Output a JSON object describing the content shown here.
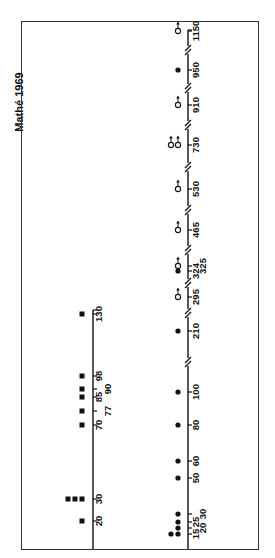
{
  "title": "Mathé 1969",
  "chart_data": {
    "type": "scatter",
    "title": "Mathé 1969",
    "orientation": "rotated 90° (axes run vertically, values increase upward)",
    "panels": [
      {
        "name": "left-axis",
        "marker": "filled-square",
        "tick_labels": [
          "20",
          "30",
          "70",
          "77",
          "85",
          "90",
          "98",
          "130"
        ],
        "points": [
          {
            "x": 20,
            "count": 1
          },
          {
            "x": 30,
            "count": 3
          },
          {
            "x": 70,
            "count": 1
          },
          {
            "x": 77,
            "count": 1
          },
          {
            "x": 85,
            "count": 1
          },
          {
            "x": 90,
            "count": 1
          },
          {
            "x": 98,
            "count": 1
          },
          {
            "x": 130,
            "count": 1
          }
        ]
      },
      {
        "name": "right-axis",
        "axis_breaks": [
          "100-210",
          "210-295",
          "295-324",
          "325-465",
          "465-530",
          "530-730",
          "730-910",
          "910-950",
          "950-1150"
        ],
        "tick_labels": [
          "15",
          "20",
          "25",
          "30",
          "50",
          "60",
          "80",
          "100",
          "210",
          "295",
          "324",
          "325",
          "465",
          "530",
          "730",
          "910",
          "950",
          "1150"
        ],
        "points": [
          {
            "x": 15,
            "marker": "filled-circle",
            "count": 2
          },
          {
            "x": 20,
            "marker": "filled-circle",
            "count": 1
          },
          {
            "x": 25,
            "marker": "filled-circle",
            "count": 1
          },
          {
            "x": 30,
            "marker": "filled-circle",
            "count": 1
          },
          {
            "x": 50,
            "marker": "filled-circle",
            "count": 1
          },
          {
            "x": 60,
            "marker": "filled-circle",
            "count": 1
          },
          {
            "x": 80,
            "marker": "filled-circle",
            "count": 1
          },
          {
            "x": 100,
            "marker": "filled-circle",
            "count": 1
          },
          {
            "x": 210,
            "marker": "filled-circle",
            "count": 1
          },
          {
            "x": 295,
            "marker": "open-circle-arrow",
            "count": 1
          },
          {
            "x": 324,
            "marker": "filled-circle",
            "count": 1
          },
          {
            "x": 325,
            "marker": "open-circle-arrow",
            "count": 1
          },
          {
            "x": 465,
            "marker": "open-circle-arrow",
            "count": 1
          },
          {
            "x": 530,
            "marker": "open-circle-arrow",
            "count": 1
          },
          {
            "x": 730,
            "marker": "open-circle-arrow",
            "count": 2
          },
          {
            "x": 910,
            "marker": "open-circle-arrow",
            "count": 1
          },
          {
            "x": 950,
            "marker": "filled-circle",
            "count": 1
          },
          {
            "x": 1150,
            "marker": "open-circle-arrow",
            "count": 1
          }
        ]
      }
    ],
    "legend": "none",
    "grid": false
  }
}
